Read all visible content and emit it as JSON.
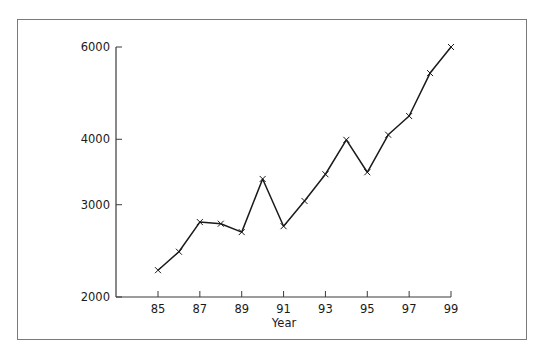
{
  "chart_data": {
    "type": "line",
    "title": "",
    "xlabel": "Year",
    "ylabel": "",
    "yscale": "log",
    "ylim": [
      2000,
      6000
    ],
    "xlim": [
      85,
      99
    ],
    "grid": false,
    "legend": null,
    "x_ticks": [
      "85",
      "87",
      "89",
      "91",
      "93",
      "95",
      "97",
      "99"
    ],
    "y_ticks": [
      "2000",
      "3000",
      "4000",
      "6000"
    ],
    "x": [
      85,
      86,
      87,
      88,
      89,
      90,
      91,
      92,
      93,
      94,
      95,
      96,
      97,
      98,
      99
    ],
    "series": [
      {
        "name": "value",
        "marker": "x",
        "color": "#1a1a1a",
        "values": [
          2250,
          2440,
          2780,
          2760,
          2660,
          3360,
          2730,
          3050,
          3430,
          3990,
          3460,
          4080,
          4430,
          5350,
          6000
        ]
      }
    ]
  },
  "colors": {
    "line": "#1a1a1a",
    "axis": "#3a3a3a",
    "frame": "#7a7a7a",
    "background": "#ffffff"
  }
}
